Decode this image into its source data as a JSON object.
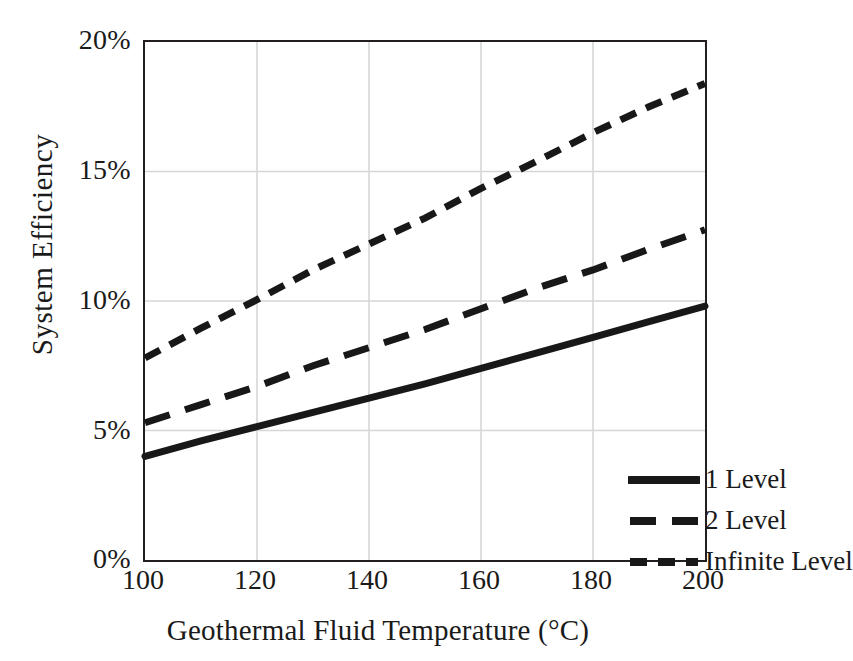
{
  "chart_data": {
    "type": "line",
    "title": "",
    "xlabel": "Geothermal Fluid Temperature (°C)",
    "ylabel": "System  Efficiency",
    "xlim": [
      100,
      200
    ],
    "ylim": [
      0,
      20
    ],
    "x_ticks": [
      "100",
      "120",
      "140",
      "160",
      "180",
      "200"
    ],
    "y_ticks": [
      "20%",
      "15%",
      "10%",
      "5%",
      "0%"
    ],
    "grid": "both",
    "legend_position": "inside-lower-right",
    "x": [
      100,
      110,
      120,
      130,
      140,
      150,
      160,
      170,
      180,
      190,
      200
    ],
    "series": [
      {
        "name": "1 Level",
        "style": "solid",
        "color": "#181818",
        "values": [
          4.0,
          4.6,
          5.15,
          5.7,
          6.25,
          6.8,
          7.4,
          8.0,
          8.6,
          9.2,
          9.8
        ]
      },
      {
        "name": "2 Level",
        "style": "long-dash",
        "color": "#181818",
        "values": [
          5.3,
          6.0,
          6.7,
          7.5,
          8.2,
          8.9,
          9.7,
          10.5,
          11.2,
          12.0,
          12.75
        ]
      },
      {
        "name": "Infinite Level",
        "style": "short-dash",
        "color": "#181818",
        "values": [
          7.8,
          8.95,
          10.05,
          11.2,
          12.2,
          13.2,
          14.35,
          15.4,
          16.5,
          17.5,
          18.4
        ]
      }
    ]
  },
  "legend": {
    "items": [
      {
        "label": "1 Level"
      },
      {
        "label": "2 Level"
      },
      {
        "label": "Infinite Level"
      }
    ]
  },
  "axes": {
    "y_title": "System  Efficiency",
    "x_title": "Geothermal Fluid Temperature (°C)",
    "y_ticks": [
      {
        "label": "20%"
      },
      {
        "label": "15%"
      },
      {
        "label": "10%"
      },
      {
        "label": "5%"
      },
      {
        "label": "0%"
      }
    ],
    "x_ticks": [
      {
        "label": "100"
      },
      {
        "label": "120"
      },
      {
        "label": "140"
      },
      {
        "label": "160"
      },
      {
        "label": "180"
      },
      {
        "label": "200"
      }
    ]
  },
  "colors": {
    "line": "#181818",
    "frame": "#231f20",
    "grid": "#d6d6d6",
    "background": "#ffffff"
  }
}
